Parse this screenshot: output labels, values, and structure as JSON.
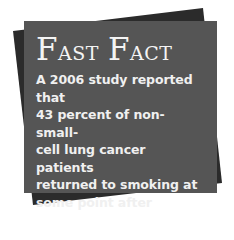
{
  "callout": {
    "title_words": [
      {
        "initial": "F",
        "rest": "ast"
      },
      {
        "initial": "F",
        "rest": "act"
      }
    ],
    "title": "Fast Fact",
    "body_lines": [
      "A 2006 study reported that",
      "43 percent of non-small-",
      "cell lung cancer patients",
      "returned to smoking at",
      "some point after surgery",
      "treatment."
    ],
    "colors": {
      "front_card": "#555555",
      "back_card": "#2b2b2b",
      "text": "#f2f2f2",
      "background": "#ffffff"
    }
  }
}
